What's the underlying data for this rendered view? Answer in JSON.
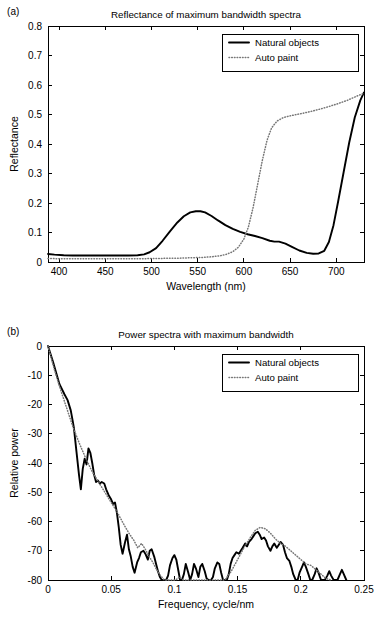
{
  "figure": {
    "panel_a_label": "(a)",
    "panel_b_label": "(b)"
  },
  "chart_data": [
    {
      "panel": "(a)",
      "type": "line",
      "title": "Reflectance of maximum bandwidth spectra",
      "xlabel": "Wavelength (nm)",
      "ylabel": "Reflectance",
      "xlim": [
        388,
        730
      ],
      "ylim": [
        0,
        0.8
      ],
      "xticks": [
        400,
        450,
        500,
        550,
        600,
        650,
        700
      ],
      "xticklabels": [
        "400",
        "450",
        "500",
        "550",
        "600",
        "650",
        "700"
      ],
      "yticks": [
        0,
        0.1,
        0.2,
        0.3,
        0.4,
        0.5,
        0.6,
        0.7,
        0.8
      ],
      "yticklabels": [
        "0",
        "0.1",
        "0.2",
        "0.3",
        "0.4",
        "0.5",
        "0.6",
        "0.7",
        "0.8"
      ],
      "grid": false,
      "legend_position": "upper right",
      "legend": [
        "Natural objects",
        "Auto paint"
      ],
      "series": [
        {
          "name": "Natural objects",
          "style": "solid",
          "x": [
            388,
            395,
            405,
            415,
            425,
            435,
            445,
            455,
            465,
            475,
            485,
            492,
            498,
            505,
            512,
            520,
            528,
            535,
            542,
            548,
            553,
            558,
            565,
            572,
            580,
            588,
            596,
            604,
            612,
            620,
            628,
            633,
            638,
            645,
            652,
            660,
            668,
            675,
            681,
            687,
            692,
            697,
            702,
            708,
            714,
            720,
            726,
            730
          ],
          "y": [
            0.027,
            0.025,
            0.023,
            0.022,
            0.022,
            0.022,
            0.022,
            0.022,
            0.022,
            0.022,
            0.023,
            0.026,
            0.033,
            0.047,
            0.072,
            0.104,
            0.134,
            0.155,
            0.168,
            0.172,
            0.172,
            0.168,
            0.156,
            0.141,
            0.125,
            0.112,
            0.102,
            0.094,
            0.088,
            0.081,
            0.072,
            0.069,
            0.069,
            0.062,
            0.051,
            0.039,
            0.031,
            0.028,
            0.029,
            0.038,
            0.068,
            0.125,
            0.205,
            0.305,
            0.405,
            0.49,
            0.548,
            0.575
          ]
        },
        {
          "name": "Auto paint",
          "style": "dotted",
          "x": [
            388,
            400,
            415,
            430,
            445,
            460,
            475,
            490,
            500,
            510,
            520,
            530,
            540,
            550,
            558,
            566,
            574,
            581,
            588,
            594,
            600,
            605,
            610,
            615,
            620,
            625,
            630,
            636,
            643,
            652,
            662,
            672,
            682,
            692,
            702,
            712,
            722,
            730
          ],
          "y": [
            0.012,
            0.011,
            0.011,
            0.011,
            0.011,
            0.011,
            0.011,
            0.011,
            0.012,
            0.012,
            0.013,
            0.013,
            0.014,
            0.015,
            0.016,
            0.018,
            0.021,
            0.026,
            0.035,
            0.05,
            0.078,
            0.12,
            0.185,
            0.265,
            0.345,
            0.412,
            0.455,
            0.478,
            0.49,
            0.497,
            0.503,
            0.51,
            0.518,
            0.527,
            0.537,
            0.548,
            0.562,
            0.572
          ]
        }
      ]
    },
    {
      "panel": "(b)",
      "type": "line",
      "title": "Power spectra with maximum bandwidth",
      "xlabel": "Frequency, cycle/nm",
      "ylabel": "Relative power",
      "xlim": [
        0,
        0.25
      ],
      "ylim": [
        -80,
        0
      ],
      "xticks": [
        0,
        0.05,
        0.1,
        0.15,
        0.2,
        0.25
      ],
      "xticklabels": [
        "0",
        "0.05",
        "0.1",
        "0.15",
        "0.2",
        "0.25"
      ],
      "yticks": [
        -80,
        -70,
        -60,
        -50,
        -40,
        -30,
        -20,
        -10,
        0
      ],
      "yticklabels": [
        "-80",
        "-70",
        "-60",
        "-50",
        "-40",
        "-30",
        "-20",
        "-10",
        "0"
      ],
      "grid": false,
      "legend_position": "upper right",
      "legend": [
        "Natural objects",
        "Auto paint"
      ],
      "series": [
        {
          "name": "Natural objects",
          "style": "solid",
          "x": [
            0.0,
            0.004,
            0.009,
            0.013,
            0.0155,
            0.018,
            0.0195,
            0.0205,
            0.0225,
            0.0245,
            0.026,
            0.0275,
            0.029,
            0.0305,
            0.032,
            0.0335,
            0.035,
            0.0365,
            0.038,
            0.0395,
            0.041,
            0.0425,
            0.0445,
            0.046,
            0.048,
            0.05,
            0.0515,
            0.053,
            0.0545,
            0.056,
            0.0575,
            0.059,
            0.061,
            0.0625,
            0.064,
            0.0655,
            0.067,
            0.0685,
            0.0705,
            0.072,
            0.0735,
            0.0755,
            0.077,
            0.079,
            0.0805,
            0.082,
            0.084,
            0.0855,
            0.087,
            0.0885,
            0.09,
            0.0915,
            0.0935,
            0.095,
            0.0965,
            0.0985,
            0.1,
            0.1015,
            0.103,
            0.1045,
            0.106,
            0.1075,
            0.109,
            0.111,
            0.1125,
            0.114,
            0.1155,
            0.117,
            0.119,
            0.1205,
            0.122,
            0.124,
            0.1255,
            0.127,
            0.129,
            0.1305,
            0.132,
            0.134,
            0.1355,
            0.137,
            0.1385,
            0.14,
            0.1415,
            0.143,
            0.1445,
            0.146,
            0.1475,
            0.149,
            0.151,
            0.1525,
            0.154,
            0.156,
            0.1575,
            0.159,
            0.161,
            0.1625,
            0.164,
            0.166,
            0.1675,
            0.169,
            0.171,
            0.1725,
            0.174,
            0.176,
            0.1775,
            0.179,
            0.181,
            0.1825,
            0.184,
            0.186,
            0.1875,
            0.189,
            0.191,
            0.1925,
            0.194,
            0.196,
            0.1975,
            0.199,
            0.201,
            0.2025,
            0.204,
            0.206,
            0.2075,
            0.209,
            0.211,
            0.2125,
            0.214,
            0.216,
            0.2175,
            0.219,
            0.221,
            0.2225,
            0.224,
            0.226,
            0.2275,
            0.229,
            0.231,
            0.2325,
            0.234,
            0.236
          ],
          "y": [
            0.0,
            -5.5,
            -13.0,
            -16.5,
            -18.5,
            -22.0,
            -25.5,
            -28.0,
            -36.0,
            -44.0,
            -49.0,
            -42.0,
            -38.5,
            -40.5,
            -35.0,
            -36.5,
            -40.0,
            -44.0,
            -46.5,
            -46.0,
            -47.0,
            -46.5,
            -47.0,
            -49.0,
            -51.0,
            -52.5,
            -54.0,
            -53.5,
            -57.0,
            -62.0,
            -68.0,
            -71.0,
            -67.0,
            -64.5,
            -69.5,
            -72.0,
            -75.5,
            -77.5,
            -74.0,
            -72.5,
            -70.5,
            -70.0,
            -71.0,
            -73.0,
            -70.0,
            -69.5,
            -72.0,
            -74.5,
            -77.0,
            -79.0,
            -80.0,
            -80.0,
            -80.0,
            -78.5,
            -75.0,
            -72.5,
            -71.5,
            -73.0,
            -76.5,
            -80.0,
            -80.0,
            -78.0,
            -74.5,
            -77.5,
            -80.0,
            -78.0,
            -74.5,
            -76.0,
            -79.0,
            -75.5,
            -74.5,
            -77.0,
            -79.5,
            -80.0,
            -80.0,
            -79.0,
            -76.0,
            -74.0,
            -74.5,
            -77.5,
            -80.0,
            -80.0,
            -80.0,
            -78.0,
            -74.5,
            -72.5,
            -71.5,
            -70.5,
            -71.0,
            -70.0,
            -69.0,
            -67.5,
            -68.5,
            -67.0,
            -66.0,
            -65.0,
            -64.0,
            -63.5,
            -64.5,
            -66.0,
            -65.5,
            -66.5,
            -68.5,
            -70.0,
            -68.5,
            -67.5,
            -69.0,
            -68.0,
            -67.0,
            -68.0,
            -70.5,
            -72.5,
            -73.5,
            -75.5,
            -78.0,
            -80.0,
            -80.0,
            -77.5,
            -75.5,
            -74.0,
            -75.5,
            -78.0,
            -80.0,
            -80.0,
            -78.0,
            -76.0,
            -77.5,
            -80.0,
            -80.0,
            -80.0,
            -78.5,
            -77.0,
            -78.5,
            -80.0,
            -80.0,
            -80.0,
            -78.0,
            -76.5,
            -78.0,
            -80.0
          ]
        },
        {
          "name": "Auto paint",
          "style": "dotted",
          "x": [
            0.0,
            0.005,
            0.01,
            0.015,
            0.02,
            0.025,
            0.03,
            0.035,
            0.04,
            0.045,
            0.05,
            0.055,
            0.06,
            0.064,
            0.068,
            0.071,
            0.074,
            0.077,
            0.08,
            0.083,
            0.086,
            0.089,
            0.092,
            0.095,
            0.098,
            0.101,
            0.104,
            0.107,
            0.11,
            0.115,
            0.12,
            0.125,
            0.13,
            0.135,
            0.14,
            0.145,
            0.15,
            0.155,
            0.16,
            0.164,
            0.168,
            0.172,
            0.176,
            0.18,
            0.184,
            0.188,
            0.192,
            0.196,
            0.2,
            0.204,
            0.208,
            0.212,
            0.216,
            0.22,
            0.224
          ],
          "y": [
            0.0,
            -8.0,
            -15.0,
            -21.5,
            -28.0,
            -33.5,
            -38.5,
            -43.0,
            -46.5,
            -50.0,
            -53.5,
            -57.0,
            -61.0,
            -64.0,
            -66.5,
            -69.0,
            -67.5,
            -69.5,
            -72.0,
            -74.0,
            -76.5,
            -78.5,
            -80.0,
            -80.0,
            -80.0,
            -80.0,
            -79.0,
            -80.0,
            -80.0,
            -80.0,
            -80.0,
            -80.0,
            -80.0,
            -80.0,
            -80.0,
            -77.0,
            -73.0,
            -69.0,
            -65.5,
            -63.0,
            -62.0,
            -62.5,
            -64.0,
            -66.0,
            -67.5,
            -68.5,
            -70.0,
            -71.5,
            -73.0,
            -74.5,
            -75.0,
            -76.5,
            -78.0,
            -79.5,
            -80.0
          ]
        }
      ]
    }
  ]
}
